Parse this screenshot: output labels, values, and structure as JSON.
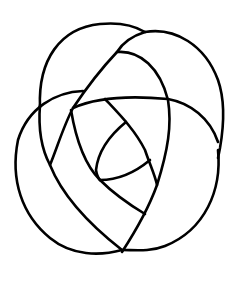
{
  "figure": {
    "type": "knot-diagram",
    "stroke_color": "#000000",
    "background_color": "#ffffff",
    "width": 241,
    "height": 282
  }
}
